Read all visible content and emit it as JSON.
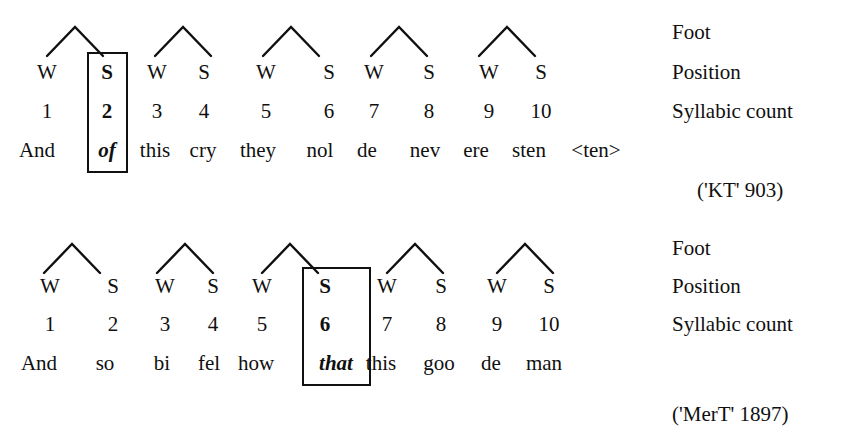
{
  "figure": {
    "legend_labels": [
      "Foot",
      "Position",
      "Syllabic count"
    ]
  },
  "scansions": [
    {
      "id": "scansion-1",
      "citation": "('KT' 903)",
      "positions": [
        "W",
        "S",
        "W",
        "S",
        "W",
        "S",
        "W",
        "S",
        "W",
        "S"
      ],
      "counts": [
        "1",
        "2",
        "3",
        "4",
        "5",
        "6",
        "7",
        "8",
        "9",
        "10"
      ],
      "words": [
        "And",
        "of",
        "this",
        "cry",
        "they",
        "nol",
        "de",
        "nev",
        "ere",
        "sten"
      ],
      "extra_word": "<ten>",
      "highlight_index": 1,
      "feet": 5,
      "legend_labels": [
        "Foot",
        "Position",
        "Syllabic count"
      ]
    },
    {
      "id": "scansion-2",
      "citation": "('MerT' 1897)",
      "positions": [
        "W",
        "S",
        "W",
        "S",
        "W",
        "S",
        "W",
        "S",
        "W",
        "S"
      ],
      "counts": [
        "1",
        "2",
        "3",
        "4",
        "5",
        "6",
        "7",
        "8",
        "9",
        "10"
      ],
      "words": [
        "And",
        "so",
        "bi",
        "fel",
        "how",
        "that",
        "this",
        "goo",
        "de",
        "man"
      ],
      "extra_word": "",
      "highlight_index": 5,
      "feet": 5,
      "legend_labels": [
        "Foot",
        "Position",
        "Syllabic count"
      ]
    }
  ],
  "colors": {
    "ink": "#101010",
    "box_border": "#111111",
    "background": "#ffffff"
  }
}
